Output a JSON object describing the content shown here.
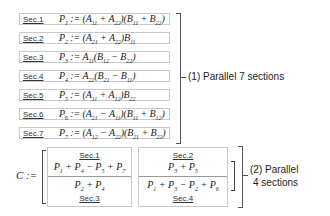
{
  "sections": [
    {
      "label": "Sec.1",
      "formula_html": "P<sub>1</sub> := (A<sub>11</sub> + A<sub>22</sub>)(B<sub>11</sub> + B<sub>22</sub>)"
    },
    {
      "label": "Sec.2",
      "formula_html": "P<sub>2</sub> := (A<sub>21</sub> + A<sub>22</sub>)B<sub>11</sub>"
    },
    {
      "label": "Sec.3",
      "formula_html": "P<sub>3</sub> := A<sub>11</sub>(B<sub>12</sub> − B<sub>22</sub>)"
    },
    {
      "label": "Sec.4",
      "formula_html": "P<sub>4</sub> := A<sub>22</sub>(B<sub>21</sub> − B<sub>11</sub>)"
    },
    {
      "label": "Sec.5",
      "formula_html": "P<sub>5</sub> := (A<sub>11</sub> + A<sub>12</sub>)B<sub>22</sub>"
    },
    {
      "label": "Sec.6",
      "formula_html": "P<sub>6</sub> := (A<sub>21</sub> − A<sub>11</sub>)(B<sub>11</sub> + B<sub>12</sub>)"
    },
    {
      "label": "Sec.7",
      "formula_html": "P<sub>7</sub> := (A<sub>12</sub> − A<sub>22</sub>)(B<sub>21</sub> + B<sub>22</sub>)"
    }
  ],
  "stage1_label": "(1) Parallel 7 sections",
  "matrix": {
    "prefix": "C :=",
    "cells": [
      {
        "label": "Sec.1",
        "formula_html": "P<sub>1</sub> + P<sub>4</sub> − P<sub>5</sub> + P<sub>7</sub>"
      },
      {
        "label": "Sec.2",
        "formula_html": "P<sub>3</sub> + P<sub>5</sub>"
      },
      {
        "label": "Sec.3",
        "formula_html": "P<sub>2</sub> + P<sub>4</sub>"
      },
      {
        "label": "Sec.4",
        "formula_html": "P<sub>1</sub> + P<sub>3</sub> − P<sub>2</sub> + P<sub>6</sub>"
      }
    ]
  },
  "stage2_label_line1": "(2) Parallel",
  "stage2_label_line2": "4 sections"
}
